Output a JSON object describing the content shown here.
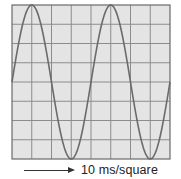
{
  "chart_data": {
    "type": "line",
    "title": "",
    "xlabel": "10 ms/square",
    "ylabel": "",
    "grid": true,
    "grid_columns": 8,
    "grid_rows": 8,
    "x_scale_ms_per_square": 10,
    "xlim_squares": [
      0,
      8
    ],
    "ylim_squares": [
      -4,
      4
    ],
    "series": [
      {
        "name": "sine wave",
        "waveform": "sine",
        "amplitude_squares": 4,
        "period_squares": 4,
        "period_ms": 40,
        "frequency_hz": 25,
        "peaks_x_squares": [
          1,
          5
        ],
        "troughs_x_squares": [
          3,
          7
        ],
        "x": [
          0,
          0.5,
          1,
          1.5,
          2,
          2.5,
          3,
          3.5,
          4,
          4.5,
          5,
          5.5,
          6,
          6.5,
          7,
          7.5,
          8
        ],
        "values": [
          0,
          2.83,
          4,
          2.83,
          0,
          -2.83,
          -4,
          -2.83,
          0,
          2.83,
          4,
          2.83,
          0,
          -2.83,
          -4,
          -2.83,
          0
        ]
      }
    ],
    "colors": {
      "background": "#e4e4e4",
      "grid": "#8c8c8c",
      "border": "#6a6a6a",
      "trace": "#6b6b6b"
    }
  },
  "caption": {
    "label": "10 ms/square",
    "arrow": "right-arrow"
  }
}
